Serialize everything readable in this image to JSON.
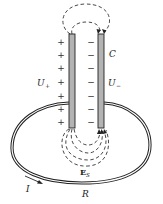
{
  "diagram": {
    "colors": {
      "plate_fill": "#b3b3b3",
      "stroke": "#222222",
      "dashed": "#333333",
      "background": "#ffffff"
    },
    "labels": {
      "capacitor": "C",
      "u_plus": "U",
      "u_plus_sub": "+",
      "u_minus": "U",
      "u_minus_sub": "−",
      "field": "E",
      "field_sub": "S",
      "current": "I",
      "resistor": "R"
    },
    "plus_signs": [
      "+",
      "+",
      "+",
      "+",
      "+",
      "+",
      "+"
    ],
    "minus_signs": [
      "−",
      "−",
      "−",
      "−",
      "−",
      "−",
      "−"
    ]
  }
}
